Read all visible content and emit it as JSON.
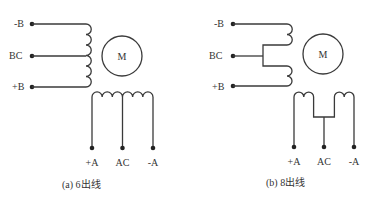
{
  "panels": [
    {
      "id": "six-wire",
      "caption": "(a) 6出线",
      "motor_label": "M",
      "b_terminals": [
        "-B",
        "BC",
        "+B"
      ],
      "a_terminals": [
        "+A",
        "AC",
        "-A"
      ]
    },
    {
      "id": "eight-wire",
      "caption": "(b) 8出线",
      "motor_label": "M",
      "b_terminals": [
        "-B",
        "BC",
        "+B"
      ],
      "a_terminals": [
        "+A",
        "AC",
        "-A"
      ]
    }
  ],
  "colors": {
    "line": "#3a3a3a",
    "dot": "#222222",
    "text": "#333333",
    "background": "#ffffff"
  }
}
